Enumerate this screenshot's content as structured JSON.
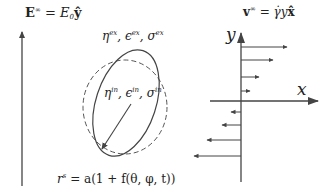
{
  "labels": {
    "efield": {
      "vec": "E",
      "sup": "∞",
      "eq": " = E",
      "sub": "0",
      "hat": "ŷ"
    },
    "vfield": {
      "vec": "v",
      "sup": "∞",
      "eq": " = γ̇y",
      "hat": "x̂"
    },
    "exterior": {
      "eta": "η",
      "eta_sup": "ex",
      "eps": "ϵ",
      "eps_sup": "ex",
      "sig": "σ",
      "sig_sup": "ex",
      "sep": ", "
    },
    "interior": {
      "eta": "η",
      "eta_sup": "in",
      "eps": "ϵ",
      "eps_sup": "in",
      "sig": "σ",
      "sig_sup": "in",
      "sep": ", "
    },
    "radius_eq": {
      "r": "r",
      "r_sup": "s",
      "rest": " = a(1 + f(θ, φ, t))"
    },
    "axis_y": "y",
    "axis_x": "x"
  },
  "colors": {
    "stroke": "#444444",
    "text": "#222222"
  },
  "flow_arrows": [
    {
      "y": 47,
      "x_end": 287
    },
    {
      "y": 60,
      "x_end": 273
    },
    {
      "y": 77,
      "x_end": 259
    },
    {
      "y": 91,
      "x_end": 250
    },
    {
      "y": 112,
      "x_end": 231
    },
    {
      "y": 125,
      "x_end": 222
    },
    {
      "y": 140,
      "x_end": 207
    },
    {
      "y": 156,
      "x_end": 196
    }
  ]
}
